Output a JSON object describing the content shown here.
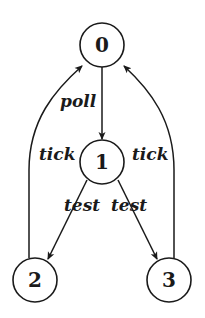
{
  "diagram": {
    "type": "state-transition-graph",
    "nodes": [
      {
        "id": "0",
        "label": "0"
      },
      {
        "id": "1",
        "label": "1"
      },
      {
        "id": "2",
        "label": "2"
      },
      {
        "id": "3",
        "label": "3"
      }
    ],
    "edges": [
      {
        "from": "0",
        "to": "1",
        "label": "poll"
      },
      {
        "from": "1",
        "to": "2",
        "label": "test"
      },
      {
        "from": "1",
        "to": "3",
        "label": "test"
      },
      {
        "from": "2",
        "to": "0",
        "label": "tick"
      },
      {
        "from": "3",
        "to": "0",
        "label": "tick"
      }
    ]
  }
}
